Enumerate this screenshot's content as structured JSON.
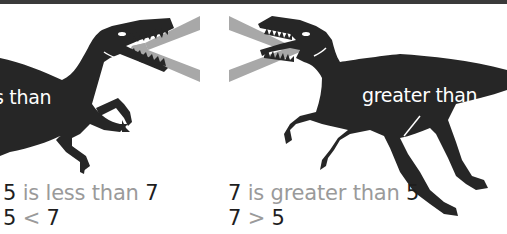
{
  "illustration": {
    "top_border_color": "#3a3a3a",
    "dino_color": "#262626",
    "symbol_color": "#a8a8a8",
    "less_than_dino": {
      "label": "less than",
      "visible_label": "s than",
      "symbol": "<"
    },
    "greater_than_dino": {
      "label": "greater than",
      "symbol": ">"
    }
  },
  "captions": {
    "left": {
      "line1": {
        "a": "5",
        "text": " is less than ",
        "b": "7"
      },
      "line2": {
        "a": "5",
        "op": " < ",
        "b": "7"
      }
    },
    "right": {
      "line1": {
        "a": "7",
        "text": " is greater than ",
        "b": "5"
      },
      "line2": {
        "a": "7",
        "op": " > ",
        "b": "5"
      }
    }
  }
}
